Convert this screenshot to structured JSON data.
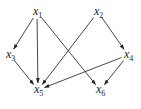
{
  "diagram": {
    "type": "directed-acyclic-graph",
    "nodes": [
      {
        "id": "x1",
        "base": "x",
        "sub": "1",
        "x": 37,
        "y": 12
      },
      {
        "id": "x2",
        "base": "x",
        "sub": "2",
        "x": 98,
        "y": 12
      },
      {
        "id": "x3",
        "base": "x",
        "sub": "3",
        "x": 10,
        "y": 55
      },
      {
        "id": "x4",
        "base": "x",
        "sub": "4",
        "x": 128,
        "y": 55
      },
      {
        "id": "x5",
        "base": "x",
        "sub": "5",
        "x": 38,
        "y": 90
      },
      {
        "id": "x6",
        "base": "x",
        "sub": "6",
        "x": 100,
        "y": 90
      }
    ],
    "edges": [
      {
        "from": "x1",
        "to": "x3"
      },
      {
        "from": "x1",
        "to": "x5"
      },
      {
        "from": "x1",
        "to": "x6"
      },
      {
        "from": "x2",
        "to": "x5"
      },
      {
        "from": "x2",
        "to": "x4"
      },
      {
        "from": "x3",
        "to": "x5"
      },
      {
        "from": "x4",
        "to": "x5"
      },
      {
        "from": "x4",
        "to": "x6"
      }
    ],
    "colors": {
      "edge": "#333333",
      "label": "#222222",
      "background": "#ffffff"
    }
  }
}
